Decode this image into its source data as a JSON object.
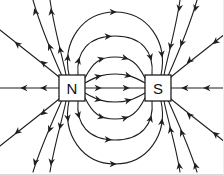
{
  "diagram": {
    "kind": "magnetic-field-lines-between-unlike-poles",
    "background_color": "#ffffff",
    "line_color": "#1f1f1f",
    "magnets": [
      {
        "label": "N",
        "pole": "north",
        "box": {
          "x": 59,
          "y": 75,
          "w": 26,
          "h": 26
        }
      },
      {
        "label": "S",
        "pole": "south",
        "box": {
          "x": 145,
          "y": 75,
          "w": 26,
          "h": 26
        }
      }
    ],
    "field_lines": [
      {
        "name": "center-axis-line",
        "path": "M 0 88 L 224 88"
      },
      {
        "name": "arc-top-outer",
        "path": "M 69 75 C 62 42 82 12 115 12 C 148 12 168 42 161 75"
      },
      {
        "name": "arc-top-second",
        "path": "M 78 75 C 76 52 88 36 115 36 C 142 36 154 52 152 75"
      },
      {
        "name": "arc-top-third",
        "path": "M 85 78 C 93 62 100 57 115 57 C 130 57 137 62 145 78"
      },
      {
        "name": "arc-top-inner",
        "path": "M 85 83 C 97 76 104 74 115 74 C 126 74 133 76 145 83"
      },
      {
        "name": "arc-bottom-inner",
        "path": "M 85 93 C 97 100 104 102 115 102 C 126 102 133 100 145 93"
      },
      {
        "name": "arc-bottom-third",
        "path": "M 85 98 C 93 114 100 119 115 119 C 130 119 137 114 145 98"
      },
      {
        "name": "arc-bottom-second",
        "path": "M 78 101 C 76 124 88 140 115 140 C 142 140 154 124 152 101"
      },
      {
        "name": "arc-bottom-outer",
        "path": "M 69 101 C 62 134 82 164 115 164 C 148 164 168 134 161 101"
      },
      {
        "name": "north-up",
        "path": "M 66 75 C 62 55 54 28 50 0"
      },
      {
        "name": "north-up-left",
        "path": "M 62 76 C 54 58 41 28 33 0"
      },
      {
        "name": "north-left-upper",
        "path": "M 59 77 C 46 66 20 46 0 30"
      },
      {
        "name": "north-left-lower",
        "path": "M 59 99 C 46 110 20 130 0 146"
      },
      {
        "name": "north-down-left",
        "path": "M 62 100 C 54 118 41 146 33 172"
      },
      {
        "name": "north-down",
        "path": "M 66 101 C 62 121 54 146 50 172"
      },
      {
        "name": "south-up",
        "path": "M 164 75 C 168 55 176 28 180 0"
      },
      {
        "name": "south-up-right",
        "path": "M 168 76 C 176 58 189 28 197 0"
      },
      {
        "name": "south-right-upper",
        "path": "M 171 77 C 184 66 210 46 230 30"
      },
      {
        "name": "south-right-lower",
        "path": "M 171 99 C 184 110 210 130 230 146"
      },
      {
        "name": "south-down-right",
        "path": "M 168 100 C 176 118 189 146 197 172"
      },
      {
        "name": "south-down",
        "path": "M 164 101 C 168 121 176 146 180 172"
      }
    ],
    "arrowheads": [
      [
        22,
        88,
        180
      ],
      [
        42,
        88,
        180
      ],
      [
        100,
        88,
        0
      ],
      [
        128,
        88,
        0
      ],
      [
        183,
        88,
        180
      ],
      [
        205,
        88,
        180
      ],
      [
        68,
        56,
        -84
      ],
      [
        115,
        12,
        0
      ],
      [
        162,
        56,
        84
      ],
      [
        79,
        59,
        -75
      ],
      [
        110,
        36.3,
        -3
      ],
      [
        151,
        59,
        75
      ],
      [
        103,
        58.5,
        -15
      ],
      [
        127,
        58.5,
        15
      ],
      [
        100,
        76,
        -13
      ],
      [
        130,
        76,
        13
      ],
      [
        100,
        100,
        13
      ],
      [
        130,
        100,
        -13
      ],
      [
        103,
        117.5,
        15
      ],
      [
        127,
        117.5,
        -15
      ],
      [
        79,
        117,
        75
      ],
      [
        110,
        139.7,
        3
      ],
      [
        151,
        117,
        -75
      ],
      [
        68,
        120,
        84
      ],
      [
        115,
        164,
        0
      ],
      [
        162,
        120,
        -84
      ],
      [
        59.8,
        48,
        -103
      ],
      [
        51,
        10,
        -98
      ],
      [
        49,
        45,
        -112
      ],
      [
        34.7,
        10,
        -106
      ],
      [
        42,
        62,
        -141
      ],
      [
        16,
        43,
        -141
      ],
      [
        42,
        114,
        141
      ],
      [
        16,
        133,
        141
      ],
      [
        49,
        131,
        112
      ],
      [
        34.7,
        164,
        106
      ],
      [
        59.8,
        128,
        103
      ],
      [
        51,
        164,
        98
      ],
      [
        170,
        48,
        103
      ],
      [
        179,
        10,
        98
      ],
      [
        181,
        45,
        112
      ],
      [
        195,
        10,
        106
      ],
      [
        188,
        62,
        139
      ],
      [
        214,
        43,
        141
      ],
      [
        188,
        114,
        -139
      ],
      [
        214,
        133,
        -141
      ],
      [
        181,
        131,
        -112
      ],
      [
        195,
        164,
        -106
      ],
      [
        170,
        128,
        -103
      ],
      [
        179,
        164,
        -98
      ]
    ]
  }
}
